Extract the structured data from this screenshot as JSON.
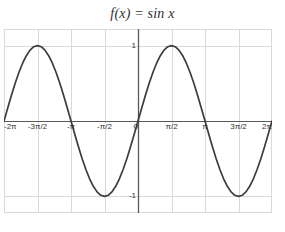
{
  "chart_data": {
    "type": "line",
    "title": "f(x) = sin x",
    "xlabel": "",
    "ylabel": "",
    "function": "sin(x)",
    "xlim": [
      -6.283185307179586,
      6.283185307179586
    ],
    "ylim": [
      -1.22,
      1.22
    ],
    "grid": true,
    "legend": null,
    "legend_position": "none",
    "line_color": "#3c3c3c",
    "grid_color": "#d9d9d9",
    "axis_color": "#595959",
    "x_ticks": [
      {
        "value": -6.283185307179586,
        "label": "-2π"
      },
      {
        "value": -4.71238898038469,
        "label": "-3π/2"
      },
      {
        "value": -3.141592653589793,
        "label": "-π"
      },
      {
        "value": -1.5707963267948966,
        "label": "-π/2"
      },
      {
        "value": 0,
        "label": "0"
      },
      {
        "value": 1.5707963267948966,
        "label": "π/2"
      },
      {
        "value": 3.141592653589793,
        "label": "π"
      },
      {
        "value": 4.71238898038469,
        "label": "3π/2"
      },
      {
        "value": 6.283185307179586,
        "label": "2π"
      }
    ],
    "y_ticks": [
      {
        "value": 1,
        "label": "1"
      },
      {
        "value": -1,
        "label": "-1"
      }
    ],
    "x": [
      -6.2832,
      -6.1087,
      -5.9341,
      -5.7596,
      -5.5851,
      -5.4105,
      -5.236,
      -5.0615,
      -4.8869,
      -4.7124,
      -4.5379,
      -4.3633,
      -4.1888,
      -4.0143,
      -3.8397,
      -3.6652,
      -3.4907,
      -3.3161,
      -3.1416,
      -2.9671,
      -2.7925,
      -2.618,
      -2.4435,
      -2.2689,
      -2.0944,
      -1.9199,
      -1.7453,
      -1.5708,
      -1.3963,
      -1.2217,
      -1.0472,
      -0.8727,
      -0.6981,
      -0.5236,
      -0.3491,
      -0.1745,
      0,
      0.1745,
      0.3491,
      0.5236,
      0.6981,
      0.8727,
      1.0472,
      1.2217,
      1.3963,
      1.5708,
      1.7453,
      1.9199,
      2.0944,
      2.2689,
      2.4435,
      2.618,
      2.7925,
      2.9671,
      3.1416,
      3.3161,
      3.4907,
      3.6652,
      3.8397,
      4.0143,
      4.1888,
      4.3633,
      4.5379,
      4.7124,
      4.8869,
      5.0615,
      5.236,
      5.4105,
      5.5851,
      5.7596,
      5.9341,
      6.1087,
      6.2832
    ],
    "y": [
      0,
      0.1736,
      0.342,
      0.5,
      0.6428,
      0.766,
      0.866,
      0.9397,
      0.9848,
      1,
      0.9848,
      0.9397,
      0.866,
      0.766,
      0.6428,
      0.5,
      0.342,
      0.1736,
      0,
      -0.1736,
      -0.342,
      -0.5,
      -0.6428,
      -0.766,
      -0.866,
      -0.9397,
      -0.9848,
      -1,
      -0.9848,
      -0.9397,
      -0.866,
      -0.766,
      -0.6428,
      -0.5,
      -0.342,
      -0.1736,
      0,
      0.1736,
      0.342,
      0.5,
      0.6428,
      0.766,
      0.866,
      0.9397,
      0.9848,
      1,
      0.9848,
      0.9397,
      0.866,
      0.766,
      0.6428,
      0.5,
      0.342,
      0.1736,
      0,
      -0.1736,
      -0.342,
      -0.5,
      -0.6428,
      -0.766,
      -0.866,
      -0.9397,
      -0.9848,
      -1,
      -0.9848,
      -0.9397,
      -0.866,
      -0.766,
      -0.6428,
      -0.5,
      -0.342,
      -0.1736,
      0
    ],
    "annotations": []
  }
}
